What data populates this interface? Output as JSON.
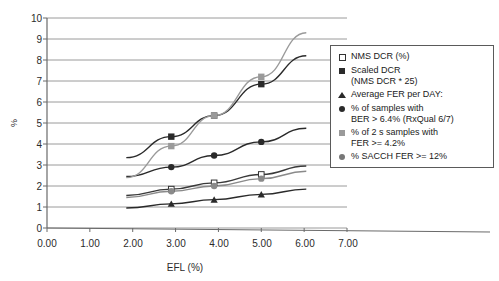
{
  "chart_data": {
    "type": "line",
    "title": "",
    "xlabel": "EFL (%)",
    "ylabel": "%",
    "xlim": [
      0.0,
      7.0
    ],
    "ylim": [
      0,
      10
    ],
    "xticks": [
      "0.00",
      "1.00",
      "2.00",
      "3.00",
      "4.00",
      "5.00",
      "6.00",
      "7.00"
    ],
    "yticks": [
      "0",
      "1",
      "2",
      "3",
      "4",
      "5",
      "6",
      "7",
      "8",
      "9",
      "10"
    ],
    "grid": "horizontal",
    "legend_position": "right",
    "series": [
      {
        "name": "NMS DCR (%)",
        "marker": "square-open",
        "color": "#3a3a3a",
        "x": [
          1.85,
          2.9,
          3.9,
          5.0,
          6.05
        ],
        "y": [
          1.55,
          1.85,
          2.15,
          2.55,
          2.95
        ]
      },
      {
        "name": "Scaled DCR (NMS DCR * 25)",
        "marker": "square-filled",
        "color": "#2a2a2a",
        "x": [
          1.85,
          2.9,
          3.9,
          5.0,
          6.05
        ],
        "y": [
          3.35,
          4.35,
          5.35,
          6.85,
          8.2
        ]
      },
      {
        "name": "Average FER per DAY:",
        "marker": "triangle-filled",
        "color": "#2a2a2a",
        "x": [
          1.85,
          2.9,
          3.9,
          5.0,
          6.05
        ],
        "y": [
          0.95,
          1.15,
          1.35,
          1.6,
          1.85
        ]
      },
      {
        "name": "% of samples with BER > 6.4% (RxQual 6/7)",
        "marker": "circle-filled",
        "color": "#2a2a2a",
        "x": [
          1.85,
          2.9,
          3.9,
          5.0,
          6.05
        ],
        "y": [
          2.45,
          2.9,
          3.45,
          4.1,
          4.75
        ]
      },
      {
        "name": "% of 2 s samples with FER >= 4.2%",
        "marker": "square-gray",
        "color": "#9a9a9a",
        "x": [
          1.85,
          2.9,
          3.9,
          5.0,
          6.05
        ],
        "y": [
          2.4,
          3.9,
          5.35,
          7.2,
          9.3
        ]
      },
      {
        "name": "% SACCH FER >= 12%",
        "marker": "circle-gray",
        "color": "#8a8a8a",
        "x": [
          1.85,
          2.9,
          3.9,
          5.0,
          6.05
        ],
        "y": [
          1.45,
          1.75,
          2.0,
          2.35,
          2.7
        ]
      }
    ]
  },
  "legend": {
    "items": [
      {
        "label": "NMS DCR (%)",
        "marker": "square-open"
      },
      {
        "label": "Scaled DCR\n(NMS DCR * 25)",
        "marker": "square-filled"
      },
      {
        "label": "Average FER per DAY:",
        "marker": "triangle-filled"
      },
      {
        "label": "% of samples with\nBER > 6.4% (RxQual 6/7)",
        "marker": "circle-filled"
      },
      {
        "label": "% of 2 s samples with\nFER >= 4.2%",
        "marker": "square-gray"
      },
      {
        "label": "% SACCH FER >= 12%",
        "marker": "circle-gray"
      }
    ]
  }
}
